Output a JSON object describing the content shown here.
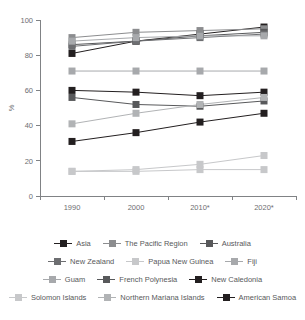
{
  "chart_data": {
    "type": "line",
    "title": "",
    "xlabel": "",
    "ylabel": "%",
    "categories": [
      "1990",
      "2000",
      "2010*",
      "2020*"
    ],
    "ylim": [
      0,
      100
    ],
    "yticks": [
      0,
      20,
      40,
      60,
      80,
      100
    ],
    "grid": false,
    "legend_position": "bottom",
    "series": [
      {
        "name": "Asia",
        "color": "#231f20",
        "values": [
          81,
          88,
          92,
          96
        ]
      },
      {
        "name": "The Pacific Region",
        "color": "#8c8d8f",
        "values": [
          90,
          93,
          94,
          95
        ]
      },
      {
        "name": "Australia",
        "color": "#58595b",
        "values": [
          86,
          88,
          91,
          93
        ]
      },
      {
        "name": "New Zealand",
        "color": "#6d6e71",
        "values": [
          85,
          88,
          90,
          92
        ]
      },
      {
        "name": "Papua New Guinea",
        "color": "#c7c8ca",
        "values": [
          14,
          14,
          15,
          15
        ]
      },
      {
        "name": "Fiji",
        "color": "#a7a9ac",
        "values": [
          88,
          90,
          91,
          91
        ]
      },
      {
        "name": "Guam",
        "color": "#a7a9ac",
        "values": [
          71,
          71,
          71,
          71
        ]
      },
      {
        "name": "French Polynesia",
        "color": "#58595b",
        "values": [
          56,
          52,
          51,
          54
        ]
      },
      {
        "name": "New Caledonia",
        "color": "#231f20",
        "values": [
          60,
          59,
          57,
          59
        ]
      },
      {
        "name": "Solomon Islands",
        "color": "#c7c8ca",
        "values": [
          14,
          15,
          18,
          23
        ]
      },
      {
        "name": "Northern Mariana Islands",
        "color": "#b1b3b5",
        "values": [
          41,
          47,
          52,
          56
        ]
      },
      {
        "name": "American Samoa",
        "color": "#231f20",
        "values": [
          31,
          36,
          42,
          47
        ]
      }
    ]
  },
  "legend": {
    "rows": [
      [
        {
          "label": "Asia",
          "series": 0
        },
        {
          "label": "The Pacific Region",
          "series": 1
        },
        {
          "label": "Australia",
          "series": 2
        }
      ],
      [
        {
          "label": "New Zealand",
          "series": 3
        },
        {
          "label": "Papua New Guinea",
          "series": 4
        },
        {
          "label": "Fiji",
          "series": 5
        }
      ],
      [
        {
          "label": "Guam",
          "series": 6
        },
        {
          "label": "French Polynesia",
          "series": 7
        },
        {
          "label": "New Caledonia",
          "series": 8
        }
      ],
      [
        {
          "label": "Solomon Islands",
          "series": 9
        },
        {
          "label": "Northern Mariana Islands",
          "series": 10
        },
        {
          "label": "American Samoa",
          "series": 11
        }
      ]
    ]
  }
}
